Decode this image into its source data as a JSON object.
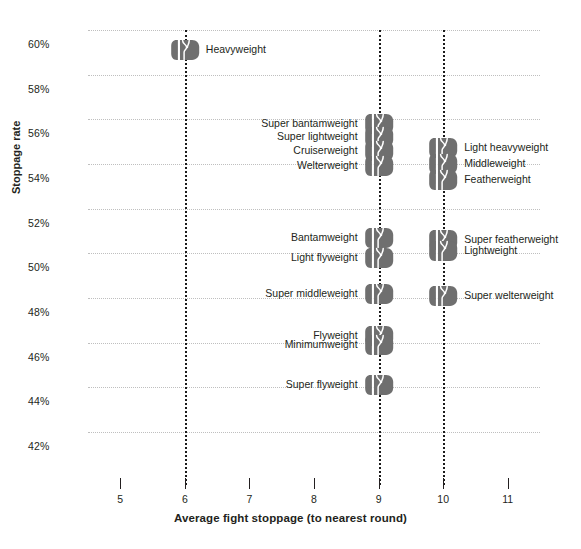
{
  "chart_data": {
    "type": "scatter",
    "title": "",
    "xlabel": "Average fight stoppage (to nearest round)",
    "ylabel": "Stoppage rate",
    "xlim": [
      4.5,
      11.5
    ],
    "ylim": [
      41.0,
      60.6
    ],
    "grid": true,
    "legend": "none",
    "xticks": [
      "5",
      "6",
      "7",
      "8",
      "9",
      "10",
      "11"
    ],
    "xtick_values": [
      5,
      6,
      7,
      8,
      9,
      10,
      11
    ],
    "yticks": [
      "60%",
      "58%",
      "56%",
      "54%",
      "52%",
      "50%",
      "48%",
      "46%",
      "44%",
      "42%"
    ],
    "ytick_values": [
      60,
      58,
      56,
      54,
      52,
      50,
      48,
      46,
      44,
      42
    ],
    "marker": "boxing-glove",
    "marker_color": "#6f6f6f",
    "gridline_color": "#bfbfbf",
    "guideline_color": "#1a1a1a",
    "guideline_x_values": [
      6,
      9,
      10
    ],
    "points": [
      {
        "label": "Heavyweight",
        "x": 6,
        "y": 59.1,
        "label_side": "right"
      },
      {
        "label": "Super bantamweight",
        "x": 9,
        "y": 55.8,
        "label_side": "left"
      },
      {
        "label": "Super lightweight",
        "x": 9,
        "y": 55.2,
        "label_side": "left"
      },
      {
        "label": "Cruiserweight",
        "x": 9,
        "y": 54.6,
        "label_side": "left"
      },
      {
        "label": "Welterweight",
        "x": 9,
        "y": 53.9,
        "label_side": "left"
      },
      {
        "label": "Light heavyweight",
        "x": 10,
        "y": 54.7,
        "label_side": "right"
      },
      {
        "label": "Middleweight",
        "x": 10,
        "y": 54.0,
        "label_side": "right"
      },
      {
        "label": "Featherweight",
        "x": 10,
        "y": 53.3,
        "label_side": "right"
      },
      {
        "label": "Bantamweight",
        "x": 9,
        "y": 50.7,
        "label_side": "left"
      },
      {
        "label": "Light flyweight",
        "x": 9,
        "y": 49.8,
        "label_side": "left"
      },
      {
        "label": "Super featherweight",
        "x": 10,
        "y": 50.6,
        "label_side": "right"
      },
      {
        "label": "Lightweight",
        "x": 10,
        "y": 50.1,
        "label_side": "right"
      },
      {
        "label": "Super middleweight",
        "x": 9,
        "y": 48.2,
        "label_side": "left"
      },
      {
        "label": "Super welterweight",
        "x": 10,
        "y": 48.1,
        "label_side": "right"
      },
      {
        "label": "Flyweight",
        "x": 9,
        "y": 46.3,
        "label_side": "left"
      },
      {
        "label": "Minimumweight",
        "x": 9,
        "y": 45.9,
        "label_side": "left"
      },
      {
        "label": "Super flyweight",
        "x": 9,
        "y": 44.1,
        "label_side": "left"
      }
    ]
  }
}
